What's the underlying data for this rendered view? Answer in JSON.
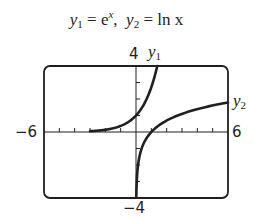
{
  "chart_data": {
    "type": "line",
    "xlabel": "",
    "ylabel": "",
    "xlim": [
      -6,
      6
    ],
    "ylim": [
      -4,
      4
    ],
    "xticks_step": 1,
    "yticks_step": 1,
    "grid": false,
    "legend": "inline labels",
    "tick_labels": {
      "xmin": "-6",
      "xmax": "6",
      "ymin": "-4",
      "ymax": "4"
    },
    "series": [
      {
        "name": "y1",
        "function": "e^x",
        "x": [
          -3,
          -2.5,
          -2,
          -1.5,
          -1,
          -0.5,
          0,
          0.5,
          1,
          1.386
        ],
        "y": [
          0.05,
          0.08,
          0.14,
          0.22,
          0.37,
          0.61,
          1.0,
          1.65,
          2.72,
          4.0
        ]
      },
      {
        "name": "y2",
        "function": "ln x",
        "x": [
          0.02,
          0.05,
          0.1,
          0.25,
          0.5,
          1,
          2,
          3,
          4,
          5,
          6
        ],
        "y": [
          -3.91,
          -3.0,
          -2.3,
          -1.39,
          -0.69,
          0,
          0.69,
          1.1,
          1.39,
          1.61,
          1.79
        ]
      }
    ]
  },
  "title": {
    "y1_label": "y",
    "y1_sub": "1",
    "eq1": " = e",
    "eq1_sup": "x",
    "sep": ",  ",
    "y2_label": "y",
    "y2_sub": "2",
    "eq2": " = ln x"
  },
  "labels": {
    "ymax": "4",
    "ymin": "−4",
    "xmin": "−6",
    "xmax": "6",
    "curve1": "y",
    "curve1_sub": "1",
    "curve2": "y",
    "curve2_sub": "2"
  }
}
